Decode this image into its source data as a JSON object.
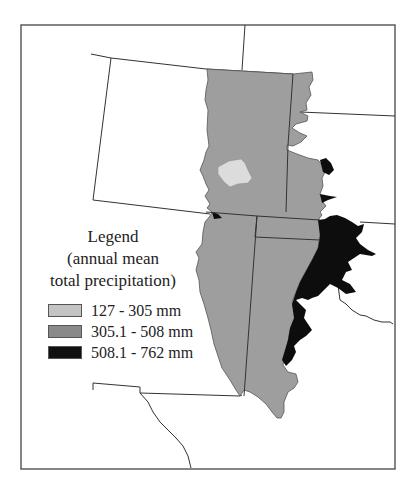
{
  "legend": {
    "title_line1": "Legend",
    "title_line2": "(annual mean",
    "title_line3": "total precipitation)",
    "items": [
      {
        "label": "127 - 305 mm",
        "color": "#c4c4c4"
      },
      {
        "label": "305.1 - 508 mm",
        "color": "#8a8a8a"
      },
      {
        "label": "508.1 - 762 mm",
        "color": "#111111"
      }
    ]
  },
  "colors": {
    "region_main": "#9e9e9e",
    "region_light": "#dcdcdc",
    "region_dark": "#0d0d0d",
    "border": "#333333",
    "background": "#ffffff"
  }
}
